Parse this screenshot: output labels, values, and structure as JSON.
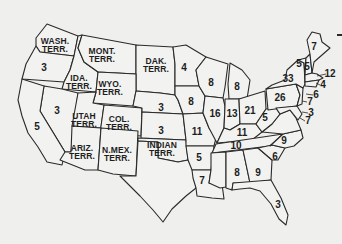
{
  "map": {
    "title": "",
    "labels": [
      {
        "id": "wash",
        "text": "WASH.\nTERR.",
        "x": 55,
        "y": 45,
        "type": "terr"
      },
      {
        "id": "mont",
        "text": "MONT.\nTERR.",
        "x": 102,
        "y": 55,
        "type": "terr"
      },
      {
        "id": "dak",
        "text": "DAK.\nTERR.",
        "x": 156,
        "y": 65,
        "type": "terr"
      },
      {
        "id": "ida",
        "text": "IDA.\nTERR.",
        "x": 79,
        "y": 82,
        "type": "terr"
      },
      {
        "id": "wyo",
        "text": "WYO.\nTERR.",
        "x": 110,
        "y": 88,
        "type": "terr"
      },
      {
        "id": "utah",
        "text": "UTAH\nTERR.",
        "x": 84,
        "y": 120,
        "type": "terr"
      },
      {
        "id": "col",
        "text": "COL.\nTERR.",
        "x": 119,
        "y": 123,
        "type": "terr"
      },
      {
        "id": "ariz",
        "text": "ARIZ.\nTERR.",
        "x": 82,
        "y": 152,
        "type": "terr"
      },
      {
        "id": "nmex",
        "text": "N.MEX.\nTERR.",
        "x": 117,
        "y": 154,
        "type": "terr"
      },
      {
        "id": "ind_t",
        "text": "INDIAN\nTERR.",
        "x": 162,
        "y": 149,
        "type": "terr"
      },
      {
        "id": "or",
        "text": "3",
        "x": 44,
        "y": 68,
        "type": "num"
      },
      {
        "id": "nv",
        "text": "3",
        "x": 57,
        "y": 111,
        "type": "num"
      },
      {
        "id": "ca",
        "text": "5",
        "x": 37,
        "y": 127,
        "type": "num"
      },
      {
        "id": "ne",
        "text": "3",
        "x": 161,
        "y": 108,
        "type": "num"
      },
      {
        "id": "ks",
        "text": "3",
        "x": 161,
        "y": 131,
        "type": "num"
      },
      {
        "id": "mn",
        "text": "4",
        "x": 184,
        "y": 68,
        "type": "num"
      },
      {
        "id": "ia",
        "text": "8",
        "x": 191,
        "y": 102,
        "type": "num"
      },
      {
        "id": "mo",
        "text": "11",
        "x": 197,
        "y": 132,
        "type": "num"
      },
      {
        "id": "ar",
        "text": "5",
        "x": 199,
        "y": 158,
        "type": "num"
      },
      {
        "id": "la",
        "text": "7",
        "x": 202,
        "y": 181,
        "type": "num"
      },
      {
        "id": "wi",
        "text": "8",
        "x": 211,
        "y": 83,
        "type": "num"
      },
      {
        "id": "mi",
        "text": "8",
        "x": 237,
        "y": 87,
        "type": "num"
      },
      {
        "id": "il",
        "text": "16",
        "x": 215,
        "y": 114,
        "type": "num"
      },
      {
        "id": "in",
        "text": "13",
        "x": 232,
        "y": 114,
        "type": "num"
      },
      {
        "id": "oh",
        "text": "21",
        "x": 250,
        "y": 111,
        "type": "num"
      },
      {
        "id": "ky",
        "text": "11",
        "x": 242,
        "y": 133,
        "type": "num"
      },
      {
        "id": "tn",
        "text": "10",
        "x": 236,
        "y": 146,
        "type": "num"
      },
      {
        "id": "ms",
        "text": "8",
        "x": 237,
        "y": 173,
        "type": "num"
      },
      {
        "id": "al",
        "text": "8",
        "x": 237,
        "y": 173,
        "type": "hidden"
      },
      {
        "id": "al2",
        "text": "8",
        "x": 237,
        "y": 173,
        "type": "hidden"
      },
      {
        "id": "al_v",
        "text": "8",
        "x": 237,
        "y": 173,
        "type": "hidden"
      },
      {
        "id": "al_r",
        "text": "8",
        "x": 237,
        "y": 173,
        "type": "hidden"
      },
      {
        "id": "alabama",
        "text": "8",
        "x": 237,
        "y": 173,
        "type": "hidden"
      },
      {
        "id": "ga",
        "text": "9",
        "x": 258,
        "y": 173,
        "type": "num"
      },
      {
        "id": "sc",
        "text": "6",
        "x": 275,
        "y": 157,
        "type": "num"
      },
      {
        "id": "nc",
        "text": "9",
        "x": 284,
        "y": 141,
        "type": "num"
      },
      {
        "id": "fl",
        "text": "3",
        "x": 278,
        "y": 205,
        "type": "num"
      },
      {
        "id": "wv",
        "text": "5",
        "x": 265,
        "y": 118,
        "type": "num"
      },
      {
        "id": "va",
        "text": "11",
        "x": 241,
        "y": 133,
        "type": "hidden"
      },
      {
        "id": "pa",
        "text": "26",
        "x": 280,
        "y": 98,
        "type": "num"
      },
      {
        "id": "ny",
        "text": "33",
        "x": 288,
        "y": 79,
        "type": "num"
      },
      {
        "id": "vt",
        "text": "5",
        "x": 299,
        "y": 64,
        "type": "num"
      },
      {
        "id": "nh",
        "text": "5",
        "x": 307,
        "y": 67,
        "type": "num"
      },
      {
        "id": "me",
        "text": "7",
        "x": 314,
        "y": 47,
        "type": "num"
      },
      {
        "id": "ma",
        "text": "12",
        "x": 330,
        "y": 74,
        "type": "num"
      },
      {
        "id": "ri",
        "text": "4",
        "x": 323,
        "y": 85,
        "type": "num"
      },
      {
        "id": "ct",
        "text": "6",
        "x": 316,
        "y": 95,
        "type": "num"
      },
      {
        "id": "nj",
        "text": "7",
        "x": 310,
        "y": 102,
        "type": "num"
      },
      {
        "id": "de",
        "text": "3",
        "x": 311,
        "y": 113,
        "type": "num"
      },
      {
        "id": "md",
        "text": "7",
        "x": 308,
        "y": 121,
        "type": "num"
      }
    ]
  }
}
